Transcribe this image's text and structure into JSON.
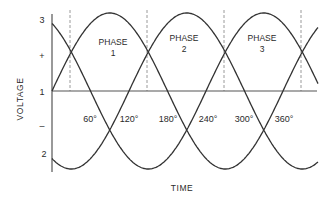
{
  "diagram": {
    "type": "three-phase-waveform",
    "y_axis": {
      "label": "VOLTAGE",
      "tick_labels": [
        "3",
        "+",
        "1",
        "–",
        "2"
      ]
    },
    "x_axis": {
      "label": "TIME",
      "angle_labels": [
        "60°",
        "120°",
        "180°",
        "240°",
        "300°",
        "360°"
      ]
    },
    "phases": [
      {
        "label_line1": "PHASE",
        "label_line2": "1"
      },
      {
        "label_line1": "PHASE",
        "label_line2": "2"
      },
      {
        "label_line1": "PHASE",
        "label_line2": "3"
      }
    ],
    "colors": {
      "curve": "#333333",
      "axis": "#555555",
      "dashed": "#999999"
    }
  }
}
